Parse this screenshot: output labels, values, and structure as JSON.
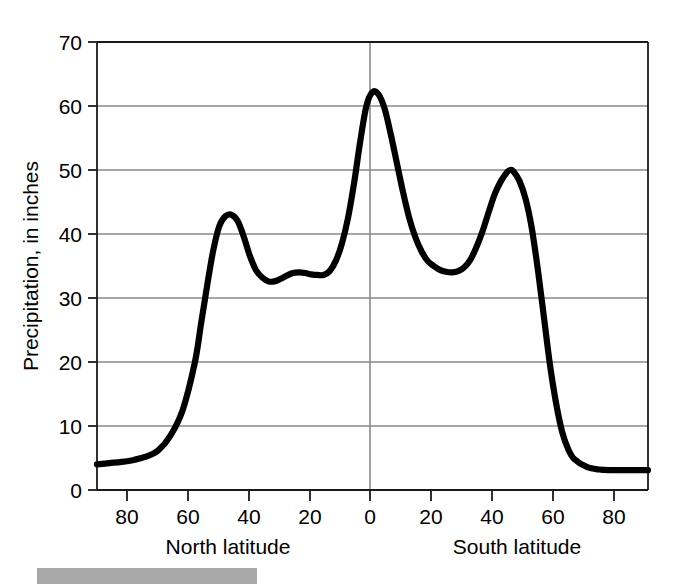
{
  "figure": {
    "background_color": "#ffffff",
    "curve_color": "#000000",
    "gridline_color": "#8a8a8a",
    "axis_color": "#1a1a1a",
    "gray_bar_color": "#a8a8a8"
  },
  "axes": {
    "y_title": "Precipitation, in inches",
    "y_ticks": [
      "0",
      "10",
      "20",
      "30",
      "40",
      "50",
      "60",
      "70"
    ],
    "x_ticks": [
      "80",
      "60",
      "40",
      "20",
      "0",
      "20",
      "40",
      "60",
      "80"
    ],
    "x_title_left": "North latitude",
    "x_title_right": "South latitude"
  },
  "chart_data": {
    "type": "line",
    "title": "",
    "subtitle": "",
    "xlabel": "Latitude (North latitude left of 0, South latitude right of 0)",
    "ylabel": "Precipitation, in inches",
    "xlim": [
      -90,
      90
    ],
    "ylim": [
      0,
      70
    ],
    "x_tick_values": [
      -80,
      -60,
      -40,
      -20,
      0,
      20,
      40,
      60,
      80
    ],
    "x_tick_labels": [
      "80",
      "60",
      "40",
      "20",
      "0",
      "20",
      "40",
      "60",
      "80"
    ],
    "y_tick_values": [
      0,
      10,
      20,
      30,
      40,
      50,
      60,
      70
    ],
    "y_tick_labels": [
      "0",
      "10",
      "20",
      "30",
      "40",
      "50",
      "60",
      "70"
    ],
    "grid": "horizontal gridlines at every 10 inches, plus one vertical gridline at 0 degrees",
    "legend": "none",
    "x_sign_convention": "negative = North latitude, positive = South latitude",
    "annotations": [
      "Equatorial maximum of about 62 inches at 0 degrees",
      "Northern mid-latitude secondary maximum of about 43 inches near 50 degrees North",
      "Southern mid-latitude secondary maximum of about 50 inches near 45 degrees South",
      "Subtropical minimum of about 32.5 inches near 42 degrees North",
      "Subtropical minimum of about 34 inches near 26 degrees South",
      "Polar minima of about 4 inches at 90 degrees North and about 3 inches at 90 degrees South"
    ],
    "series": [
      {
        "name": "Mean annual precipitation by latitude",
        "x": [
          -90,
          -86,
          -82,
          -78,
          -74,
          -70,
          -66,
          -62,
          -58,
          -56,
          -54,
          -52,
          -50,
          -48,
          -46,
          -44,
          -42,
          -40,
          -38,
          -36,
          -34,
          -32,
          -30,
          -28,
          -26,
          -24,
          -22,
          -20,
          -18,
          -16,
          -14,
          -12,
          -10,
          -8,
          -6,
          -4,
          -2,
          0,
          2,
          4,
          6,
          8,
          10,
          12,
          14,
          16,
          18,
          20,
          22,
          24,
          26,
          28,
          30,
          32,
          34,
          36,
          38,
          40,
          42,
          44,
          45,
          46,
          48,
          50,
          52,
          54,
          56,
          58,
          60,
          62,
          64,
          66,
          70,
          74,
          78,
          82,
          86,
          90
        ],
        "y": [
          4.0,
          4.2,
          4.4,
          4.7,
          5.2,
          6.2,
          8.5,
          12.5,
          20.0,
          26.0,
          32.0,
          37.5,
          41.3,
          42.8,
          43.0,
          42.0,
          39.5,
          36.5,
          34.3,
          33.2,
          32.6,
          32.6,
          33.0,
          33.5,
          33.9,
          34.0,
          33.9,
          33.7,
          33.6,
          33.6,
          34.2,
          35.8,
          38.5,
          42.5,
          48.0,
          54.5,
          60.0,
          62.2,
          61.8,
          59.5,
          55.5,
          51.0,
          46.5,
          42.5,
          39.5,
          37.3,
          35.8,
          35.0,
          34.4,
          34.1,
          34.0,
          34.2,
          34.8,
          36.0,
          38.0,
          40.5,
          43.5,
          46.3,
          48.3,
          49.7,
          50.0,
          49.8,
          48.3,
          45.5,
          41.0,
          34.5,
          27.0,
          19.5,
          13.5,
          9.0,
          6.3,
          4.8,
          3.6,
          3.2,
          3.1,
          3.1,
          3.1,
          3.1
        ]
      }
    ]
  },
  "decoration": {
    "gray_bar_label": ""
  }
}
